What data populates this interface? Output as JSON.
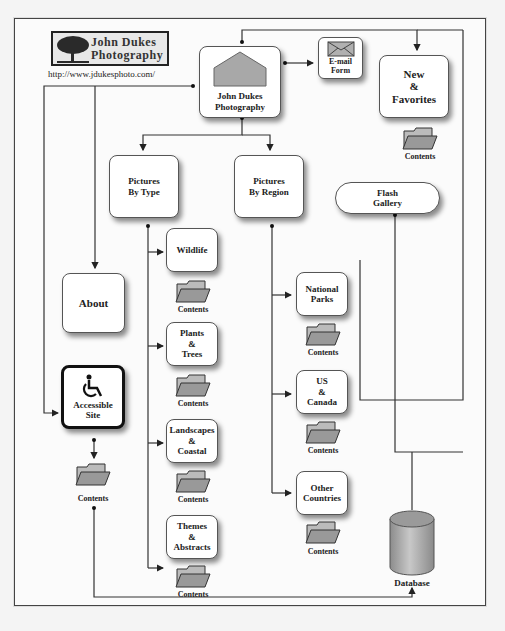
{
  "header": {
    "logo_line1": "John Dukes",
    "logo_line2": "Photography",
    "url": "http://www.jdukesphoto.com/"
  },
  "nodes": {
    "home": "John Dukes\nPhotography",
    "email": "E-mail\nForm",
    "new_favorites": "New\n&\nFavorites",
    "pictures_by_type": "Pictures\nBy Type",
    "pictures_by_region": "Pictures\nBy Region",
    "flash_gallery": "Flash\nGallery",
    "about": "About",
    "accessible_site": "Accessible\nSite",
    "wildlife": "Wildlife",
    "plants_trees": "Plants\n&\nTrees",
    "landscapes_coastal": "Landscapes\n&\nCoastal",
    "themes_abstracts": "Themes\n&\nAbstracts",
    "national_parks": "National\nParks",
    "us_canada": "US\n&\nCanada",
    "other_countries": "Other\nCountries",
    "database": "Database"
  },
  "folder_label": "Contents",
  "icons": {
    "home": "house-icon",
    "email": "envelope-icon",
    "accessible": "wheelchair-icon",
    "folder": "folder-icon",
    "database": "database-cylinder-icon",
    "logo": "tree-icon"
  },
  "colors": {
    "line": "#333333",
    "node_fill": "#ffffff",
    "shape_gray": "#a8a8a8",
    "frame": "#444444"
  }
}
